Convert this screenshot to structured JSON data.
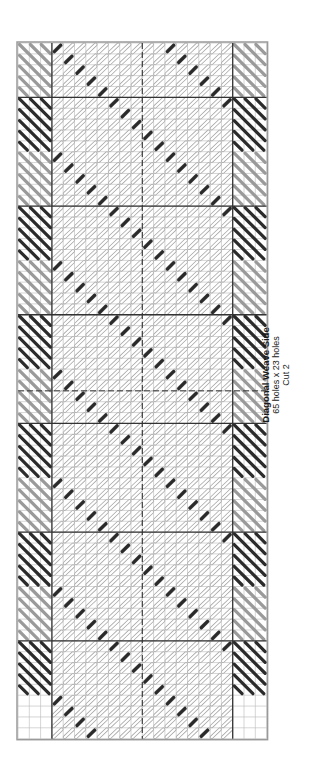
{
  "pattern": {
    "title": "Diagonal Weave Side",
    "dimensions": "65 holes x 23 holes",
    "cut": "Cut 2"
  },
  "grid": {
    "holes_tall": 65,
    "holes_wide": 23,
    "left": 18,
    "top": 43,
    "cell_w": 11.3,
    "cell_h": 10.87,
    "heavy_every": 10,
    "side_col_cells": 3,
    "colors": {
      "grid_line": "#b8b8b8",
      "heavy_line": "#333333",
      "border": "#9a9a9a",
      "dark_stitch": "#2b2b2b",
      "medium_stitch": "#9a9a9a",
      "light_stitch_fill": "#ffffff",
      "light_stitch_outline": "#a8a8a8"
    }
  },
  "legend": {
    "dark_stitch": "dark yarn",
    "medium_stitch": "medium gray yarn",
    "light_stitch": "white yarn"
  }
}
